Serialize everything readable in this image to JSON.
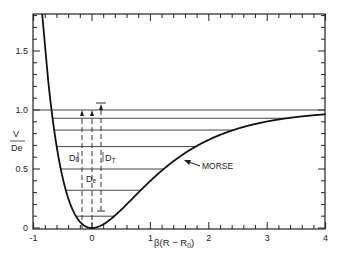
{
  "chart_data": {
    "type": "line",
    "title": "",
    "xlabel": "β(R − R0)",
    "ylabel": "V / De",
    "xlim": [
      -1,
      4
    ],
    "ylim": [
      0,
      1.8
    ],
    "x_ticks": [
      "-1",
      "0",
      "1",
      "2",
      "3",
      "4"
    ],
    "y_ticks": [
      "0",
      "0.5",
      "1.0",
      "1.5"
    ],
    "grid": false,
    "series": [
      {
        "name": "MORSE",
        "function": "V/De = (1 - exp(-x))^2",
        "x": [
          -0.7,
          -0.5,
          -0.25,
          0,
          0.5,
          1,
          1.5,
          2,
          2.5,
          3,
          4
        ],
        "y": [
          1.85,
          0.42,
          0.08,
          0,
          0.15,
          0.4,
          0.6,
          0.75,
          0.84,
          0.9,
          0.96
        ]
      }
    ],
    "energy_levels": [
      1.0,
      0.93,
      0.83,
      0.69,
      0.5,
      0.32,
      0.1
    ],
    "annotations": [
      {
        "text": "D0",
        "meaning": "dissociation energy from ground vibrational level"
      },
      {
        "text": "De",
        "meaning": "well depth"
      },
      {
        "text": "DT",
        "meaning": "arrow span"
      },
      {
        "text": "MORSE",
        "meaning": "curve label with arrow"
      }
    ]
  },
  "labels": {
    "y_num": "V",
    "y_den": "De",
    "x_axis": "β(R − R",
    "x_axis_sub": "0",
    "x_axis_end": ")",
    "curve": "MORSE",
    "d0": "D",
    "d0_sub": "0",
    "de": "D",
    "de_sub": "e",
    "dt": "D",
    "dt_sub": "T",
    "ticks_x": [
      "-1",
      "0",
      "1",
      "2",
      "3",
      "4"
    ],
    "ticks_y": [
      "0",
      "0.5",
      "1.0",
      "1.5"
    ]
  }
}
